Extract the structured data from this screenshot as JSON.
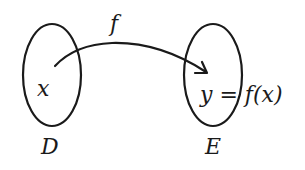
{
  "diagram": {
    "type": "function-mapping",
    "domain_set": {
      "label": "D",
      "element": "x"
    },
    "codomain_set": {
      "label": "E",
      "element": "y = f(x)"
    },
    "mapping": {
      "label": "f"
    },
    "colors": {
      "stroke": "#1a1a1a",
      "background": "#ffffff"
    }
  }
}
